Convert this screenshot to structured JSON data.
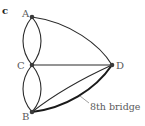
{
  "panel_label": "c",
  "nodes": [
    {
      "id": "A",
      "label": "A",
      "x": 32,
      "y": 17
    },
    {
      "id": "C",
      "label": "C",
      "x": 32,
      "y": 65
    },
    {
      "id": "B",
      "label": "B",
      "x": 32,
      "y": 112
    },
    {
      "id": "D",
      "label": "D",
      "x": 112,
      "y": 65
    }
  ],
  "edges": [
    {
      "from": "A",
      "to": "C",
      "style": "curve-left"
    },
    {
      "from": "A",
      "to": "C",
      "style": "curve-right"
    },
    {
      "from": "C",
      "to": "B",
      "style": "curve-left"
    },
    {
      "from": "C",
      "to": "B",
      "style": "curve-right"
    },
    {
      "from": "A",
      "to": "D",
      "style": "arc"
    },
    {
      "from": "C",
      "to": "D",
      "style": "straight"
    },
    {
      "from": "B",
      "to": "D",
      "style": "straight"
    },
    {
      "from": "B",
      "to": "D",
      "style": "curve-bold",
      "annotation": "8th bridge"
    }
  ],
  "annotation": {
    "text": "8th bridge"
  }
}
